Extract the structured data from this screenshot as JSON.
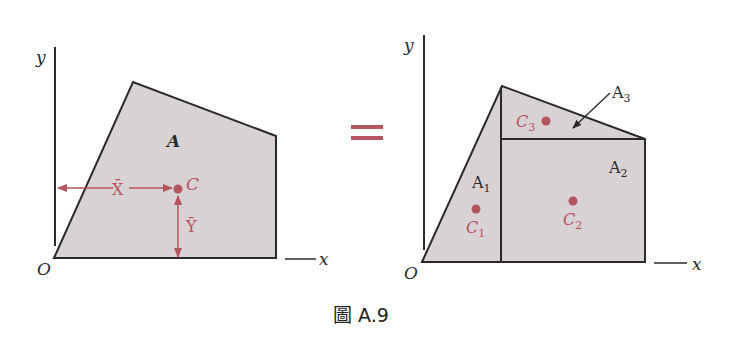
{
  "colors": {
    "fill": "#d9d2d4",
    "stroke": "#2a2a2a",
    "accent": "#b4545f"
  },
  "left_figure": {
    "axis_y_label": "y",
    "axis_x_label": "x",
    "origin_label": "O",
    "area_label": "A",
    "centroid_label": "C",
    "xbar_label": "X̄",
    "ybar_label": "Ȳ"
  },
  "equals_sign": "=",
  "right_figure": {
    "axis_y_label": "y",
    "axis_x_label": "x",
    "origin_label": "O",
    "area1_label": "A",
    "area1_sub": "1",
    "area2_label": "A",
    "area2_sub": "2",
    "area3_label": "A",
    "area3_sub": "3",
    "c1_label": "C",
    "c1_sub": "1",
    "c2_label": "C",
    "c2_sub": "2",
    "c3_label": "C",
    "c3_sub": "3"
  },
  "caption": "圖 A.9"
}
